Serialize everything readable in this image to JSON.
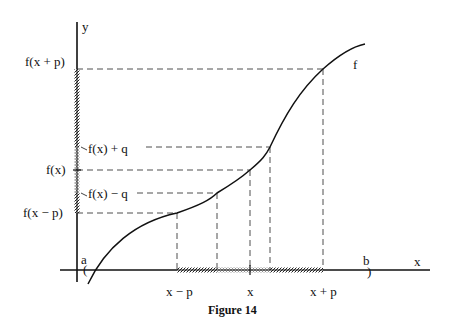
{
  "figure": {
    "caption": "Figure 14",
    "axes": {
      "x_label": "x",
      "y_label": "y"
    },
    "curve_label": "f",
    "interval": {
      "left": "a",
      "right": "b",
      "left_bracket": "(",
      "right_bracket": ")"
    },
    "y_labels": {
      "f_x_plus_p": "f(x + p)",
      "f_x_plus_q": "f(x) + q",
      "f_x": "f(x)",
      "f_x_minus_q": "f(x) − q",
      "f_x_minus_p": "f(x − p)"
    },
    "x_labels": {
      "x_minus_p": "x − p",
      "x": "x",
      "x_plus_p": "x + p"
    }
  }
}
